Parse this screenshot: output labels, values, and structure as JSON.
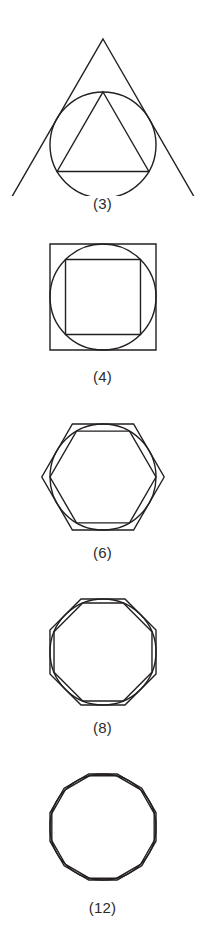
{
  "figure": {
    "stroke_color": "#231f20",
    "background_color": "#ffffff",
    "circle": {
      "center_x": 103,
      "radius": 53
    },
    "panels": [
      {
        "id": "panel-3",
        "caption": "(3)",
        "sides": 3,
        "orientation": "apex-up",
        "rotation_deg": -90,
        "inner_polygon": "triangle inscribed in circle",
        "outer_polygon": "triangle circumscribed about circle",
        "center_y": 145,
        "inner_radius": 53,
        "outer_radius": 106,
        "stroke_width": 1.4
      },
      {
        "id": "panel-4",
        "caption": "(4)",
        "sides": 4,
        "orientation": "axis-aligned",
        "rotation_deg": 45,
        "inner_polygon": "square inscribed in circle",
        "outer_polygon": "square circumscribed about circle",
        "center_y": 77,
        "inner_radius": 53,
        "outer_radius": 74.95,
        "stroke_width": 1.4
      },
      {
        "id": "panel-6",
        "caption": "(6)",
        "sides": 6,
        "orientation": "flat-top",
        "rotation_deg": 0,
        "inner_polygon": "hexagon inscribed in circle",
        "outer_polygon": "hexagon circumscribed about circle",
        "center_y": 82,
        "inner_radius": 53,
        "outer_radius": 61.2,
        "stroke_width": 1.4
      },
      {
        "id": "panel-8",
        "caption": "(8)",
        "sides": 8,
        "orientation": "flat-top",
        "rotation_deg": 22.5,
        "inner_polygon": "octagon inscribed in circle",
        "outer_polygon": "octagon circumscribed about circle",
        "center_y": 82,
        "inner_radius": 53,
        "outer_radius": 57.4,
        "stroke_width": 1.4
      },
      {
        "id": "panel-12",
        "caption": "(12)",
        "sides": 12,
        "orientation": "flat-top",
        "rotation_deg": 15,
        "inner_polygon": "dodecagon inscribed in circle",
        "outer_polygon": "dodecagon circumscribed about circle",
        "center_y": 82,
        "inner_radius": 53,
        "outer_radius": 54.87,
        "stroke_width": 1.4
      }
    ]
  },
  "chart_data": {
    "type": "diagram",
    "categories": [
      "(3)",
      "(4)",
      "(6)",
      "(8)",
      "(12)"
    ],
    "values": [
      3,
      4,
      6,
      8,
      12
    ],
    "xlabel": "",
    "ylabel": "",
    "legend": []
  }
}
